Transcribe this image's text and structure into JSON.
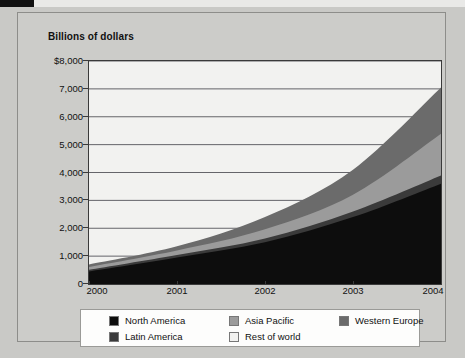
{
  "chart_data": {
    "type": "area",
    "title": "Billions of dollars",
    "xlabel": "",
    "ylabel": "Billions of dollars",
    "categories": [
      "2000",
      "2001",
      "2002",
      "2003",
      "2004"
    ],
    "x": [
      2000,
      2001,
      2002,
      2003,
      2004
    ],
    "ylim": [
      0,
      8000
    ],
    "yticks": [
      0,
      1000,
      2000,
      3000,
      4000,
      5000,
      6000,
      7000,
      8000
    ],
    "ytick_labels": [
      "0",
      "1,000",
      "2,000",
      "3,000",
      "4,000",
      "5,000",
      "6,000",
      "7,000",
      "$8,000"
    ],
    "grid": true,
    "stacked": true,
    "legend_position": "bottom",
    "series": [
      {
        "name": "North America",
        "color": "#0d0d0d",
        "values": [
          450,
          950,
          1500,
          2400,
          3600
        ]
      },
      {
        "name": "Latin America",
        "color": "#3a3a3a",
        "values": [
          60,
          90,
          130,
          200,
          290
        ]
      },
      {
        "name": "Asia Pacific",
        "color": "#9b9b9b",
        "values": [
          100,
          160,
          330,
          600,
          1500
        ]
      },
      {
        "name": "Western Europe",
        "color": "#6b6b6b",
        "values": [
          90,
          150,
          440,
          900,
          1660
        ]
      },
      {
        "name": "Rest of world",
        "color": "#f2f2f0",
        "values": [
          0,
          0,
          0,
          0,
          0
        ]
      }
    ],
    "totals": [
      700,
      1350,
      2400,
      4100,
      7050
    ]
  },
  "legend": {
    "items": [
      {
        "label": "North America",
        "color": "#0d0d0d"
      },
      {
        "label": "Asia Pacific",
        "color": "#9b9b9b"
      },
      {
        "label": "Western Europe",
        "color": "#6b6b6b"
      },
      {
        "label": "Latin America",
        "color": "#3a3a3a"
      },
      {
        "label": "Rest of world",
        "color": "#f2f2f0"
      }
    ]
  },
  "colors": {
    "page_background": "#c9c9c6",
    "card_background": "#ccccc9",
    "plot_background": "#eeeeec",
    "axis": "#3a3a3a",
    "gridline": "#55555a",
    "text": "#111111"
  }
}
